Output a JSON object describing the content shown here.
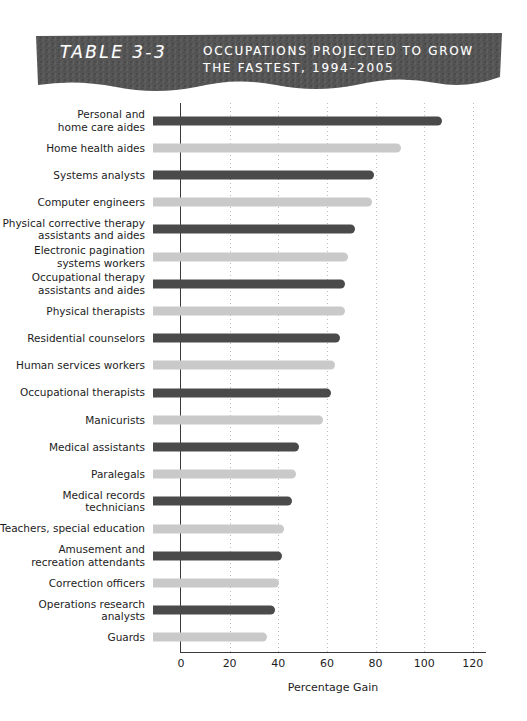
{
  "banner": {
    "table_number": "TABLE 3-3",
    "title_line1": "OCCUPATIONS PROJECTED TO GROW",
    "title_line2": "THE FASTEST, 1994–2005",
    "band_color": "#555555",
    "text_color": "#ffffff"
  },
  "chart_data": {
    "type": "bar",
    "orientation": "horizontal",
    "title": "Occupations projected to grow the fastest, 1994–2005",
    "xlabel": "Percentage Gain",
    "ylabel": "",
    "xlim": [
      0,
      125
    ],
    "xticks": [
      0,
      20,
      40,
      60,
      80,
      100,
      120
    ],
    "grid": "vertical-dotted",
    "legend": "none",
    "colors": {
      "dark": "#4a4a4a",
      "light": "#c9c9c9",
      "axis": "#3a3a3a",
      "gridline": "#bdbdbd"
    },
    "categories": [
      "Personal and home care aides",
      "Home health aides",
      "Systems analysts",
      "Computer engineers",
      "Physical corrective therapy assistants and aides",
      "Electronic pagination systems workers",
      "Occupational therapy assistants and aides",
      "Physical therapists",
      "Residential counselors",
      "Human services workers",
      "Occupational therapists",
      "Manicurists",
      "Medical assistants",
      "Paralegals",
      "Medical records technicians",
      "Teachers, special education",
      "Amusement and recreation attendants",
      "Correction officers",
      "Operations research analysts",
      "Guards"
    ],
    "values": [
      119,
      102,
      91,
      90,
      83,
      80,
      79,
      79,
      77,
      75,
      73,
      70,
      60,
      59,
      57,
      54,
      53,
      52,
      50,
      47
    ],
    "bars": [
      {
        "label_line1": "Personal and",
        "label_line2": "home care aides",
        "value": 119,
        "shade": "dark"
      },
      {
        "label_line1": "Home health aides",
        "label_line2": "",
        "value": 102,
        "shade": "light"
      },
      {
        "label_line1": "Systems analysts",
        "label_line2": "",
        "value": 91,
        "shade": "dark"
      },
      {
        "label_line1": "Computer engineers",
        "label_line2": "",
        "value": 90,
        "shade": "light"
      },
      {
        "label_line1": "Physical corrective therapy",
        "label_line2": "assistants and aides",
        "value": 83,
        "shade": "dark"
      },
      {
        "label_line1": "Electronic pagination",
        "label_line2": "systems workers",
        "value": 80,
        "shade": "light"
      },
      {
        "label_line1": "Occupational therapy",
        "label_line2": "assistants and aides",
        "value": 79,
        "shade": "dark"
      },
      {
        "label_line1": "Physical therapists",
        "label_line2": "",
        "value": 79,
        "shade": "light"
      },
      {
        "label_line1": "Residential counselors",
        "label_line2": "",
        "value": 77,
        "shade": "dark"
      },
      {
        "label_line1": "Human services workers",
        "label_line2": "",
        "value": 75,
        "shade": "light"
      },
      {
        "label_line1": "Occupational therapists",
        "label_line2": "",
        "value": 73,
        "shade": "dark"
      },
      {
        "label_line1": "Manicurists",
        "label_line2": "",
        "value": 70,
        "shade": "light"
      },
      {
        "label_line1": "Medical assistants",
        "label_line2": "",
        "value": 60,
        "shade": "dark"
      },
      {
        "label_line1": "Paralegals",
        "label_line2": "",
        "value": 59,
        "shade": "light"
      },
      {
        "label_line1": "Medical records",
        "label_line2": "technicians",
        "value": 57,
        "shade": "dark"
      },
      {
        "label_line1": "Teachers, special education",
        "label_line2": "",
        "value": 54,
        "shade": "light"
      },
      {
        "label_line1": "Amusement and",
        "label_line2": "recreation attendants",
        "value": 53,
        "shade": "dark"
      },
      {
        "label_line1": "Correction officers",
        "label_line2": "",
        "value": 52,
        "shade": "light"
      },
      {
        "label_line1": "Operations research",
        "label_line2": "analysts",
        "value": 50,
        "shade": "dark"
      },
      {
        "label_line1": "Guards",
        "label_line2": "",
        "value": 47,
        "shade": "light"
      }
    ]
  }
}
